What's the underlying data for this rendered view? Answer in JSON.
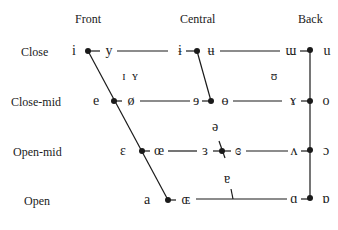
{
  "columns": {
    "front": "Front",
    "central": "Central",
    "back": "Back"
  },
  "rows": {
    "close": "Close",
    "close_mid": "Close-mid",
    "open_mid": "Open-mid",
    "open": "Open"
  },
  "vowels": {
    "close": {
      "front_unrounded": "i",
      "front_rounded": "y",
      "central_unrounded": "ɨ",
      "central_rounded": "ʉ",
      "back_unrounded": "ɯ",
      "back_rounded": "u"
    },
    "near_close": {
      "front_unrounded": "ɪ",
      "front_rounded": "ʏ",
      "back_rounded": "ʊ"
    },
    "close_mid": {
      "front_unrounded": "e",
      "front_rounded": "ø",
      "central_unrounded": "ɘ",
      "central_rounded": "ɵ",
      "back_unrounded": "ɤ",
      "back_rounded": "o"
    },
    "mid": {
      "central": "ə"
    },
    "open_mid": {
      "front_unrounded": "ɛ",
      "front_rounded": "œ",
      "central_unrounded": "ɜ",
      "central_rounded": "ɞ",
      "back_unrounded": "ʌ",
      "back_rounded": "ɔ"
    },
    "near_open": {
      "central": "ɐ"
    },
    "open": {
      "front_unrounded": "a",
      "front_rounded": "ɶ",
      "back_unrounded": "ɑ",
      "back_rounded": "ɒ"
    }
  },
  "colors": {
    "line": "#1a1a1a",
    "text": "#1a1a1a",
    "background": "#ffffff"
  }
}
